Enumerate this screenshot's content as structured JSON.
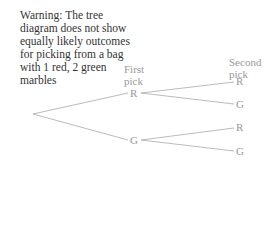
{
  "warning": "Warning: The tree diagram does not show equally likely outcomes for picking from a bag with 1 red, 2 green marbles",
  "headers": {
    "first": "First pick",
    "second": "Second pick"
  },
  "first_pick": [
    {
      "label": "R"
    },
    {
      "label": "G"
    }
  ],
  "second_pick": [
    {
      "label": "R"
    },
    {
      "label": "G"
    },
    {
      "label": "R"
    },
    {
      "label": "G"
    }
  ],
  "colors": {
    "text": "#333333",
    "tree": "#999999",
    "lines": "#aaaaaa"
  }
}
